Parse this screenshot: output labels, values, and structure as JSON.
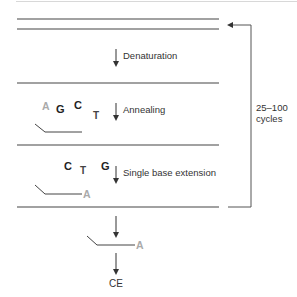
{
  "diagram": {
    "type": "process-flow",
    "steps": [
      {
        "id": "denaturation",
        "label": "Denaturation"
      },
      {
        "id": "annealing",
        "label": "Annealing"
      },
      {
        "id": "extension",
        "label": "Single base extension"
      }
    ],
    "cycle_label_line1": "25–100",
    "cycle_label_line2": "cycles",
    "output_label": "CE",
    "annealing_bases": [
      {
        "letter": "A",
        "style": "grey"
      },
      {
        "letter": "G",
        "style": "dark"
      },
      {
        "letter": "C",
        "style": "dark"
      },
      {
        "letter": "T",
        "style": "mid"
      }
    ],
    "extension_bases": [
      {
        "letter": "C",
        "style": "dark"
      },
      {
        "letter": "T",
        "style": "mid"
      },
      {
        "letter": "G",
        "style": "dark"
      }
    ],
    "incorporated_base": "A",
    "product_base": "A",
    "colors": {
      "line": "#333333",
      "incorporated_base": "#aaaaaa",
      "loop_line": "#555555"
    }
  }
}
